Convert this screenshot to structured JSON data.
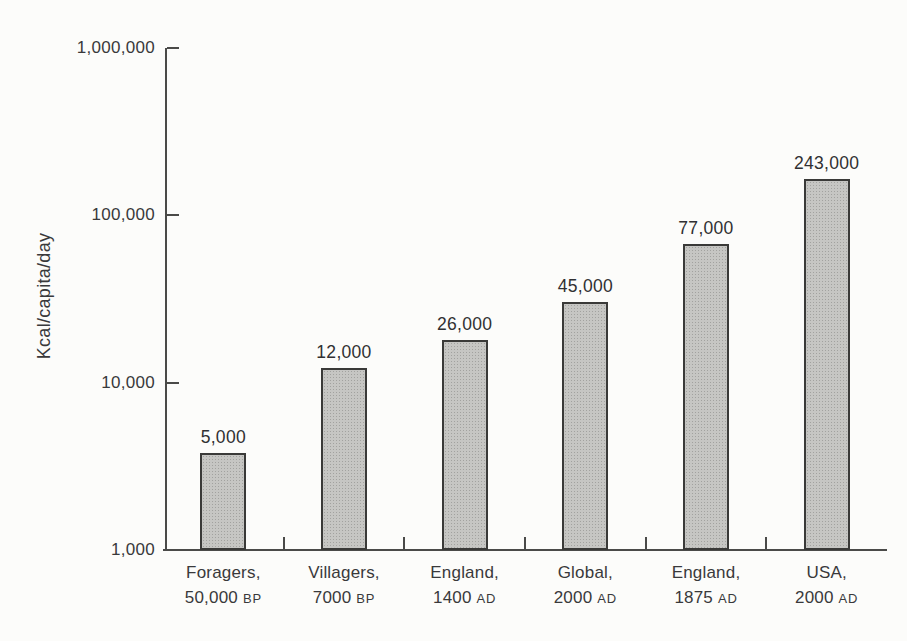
{
  "chart_data": {
    "type": "bar",
    "title": "",
    "xlabel": "",
    "ylabel": "Kcal/capita/day",
    "yscale": "log",
    "ylim": [
      1000,
      1000000
    ],
    "grid": false,
    "legend": "none",
    "bar_color": "#c6c6c3",
    "bar_border_color": "#3a3a38",
    "background_color": "#fcfcfa",
    "yticks": [
      {
        "value": 1000000,
        "label": "1,000,000"
      },
      {
        "value": 100000,
        "label": "100,000"
      },
      {
        "value": 10000,
        "label": "10,000"
      },
      {
        "value": 1000,
        "label": "1,000"
      }
    ],
    "bars": [
      {
        "value": 5000,
        "value_label": "5,000",
        "category_line1": "Foragers,",
        "category_date": "50,000",
        "category_era": "BP"
      },
      {
        "value": 12000,
        "value_label": "12,000",
        "category_line1": "Villagers,",
        "category_date": "7000",
        "category_era": "BP"
      },
      {
        "value": 26000,
        "value_label": "26,000",
        "category_line1": "England,",
        "category_date": "1400",
        "category_era": "AD"
      },
      {
        "value": 45000,
        "value_label": "45,000",
        "category_line1": "Global,",
        "category_date": "2000",
        "category_era": "AD"
      },
      {
        "value": 77000,
        "value_label": "77,000",
        "category_line1": "England,",
        "category_date": "1875",
        "category_era": "AD"
      },
      {
        "value": 243000,
        "value_label": "243,000",
        "category_line1": "USA,",
        "category_date": "2000",
        "category_era": "AD"
      }
    ],
    "layout": {
      "rendered_bar_height_fractions": [
        0.193,
        0.362,
        0.418,
        0.494,
        0.61,
        0.739
      ]
    }
  }
}
